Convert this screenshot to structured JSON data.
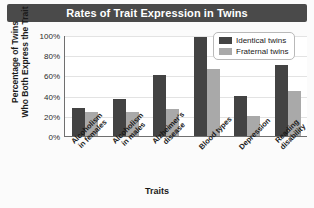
{
  "title": "Rates of Trait Expression in Twins",
  "legend": {
    "position": "top-right",
    "items": [
      {
        "label": "Identical twins",
        "color": "#434343",
        "key": "identical"
      },
      {
        "label": "Fraternal twins",
        "color": "#a9a9a9",
        "key": "fraternal"
      }
    ]
  },
  "axes": {
    "ylabel_line1": "Percentage of Twins",
    "ylabel_line2": "Who Both Express the Trait",
    "xlabel": "Traits",
    "yticks": [
      "0%",
      "20%",
      "40%",
      "60%",
      "80%",
      "100%"
    ]
  },
  "xtick_labels": [
    {
      "line1": "Alcoholism",
      "line2": "in females"
    },
    {
      "line1": "Alcoholism",
      "line2": "in males"
    },
    {
      "line1": "Alzheimer's",
      "line2": "disease"
    },
    {
      "line1": "Blood types",
      "line2": ""
    },
    {
      "line1": "Depression",
      "line2": ""
    },
    {
      "line1": "Reading",
      "line2": "disability"
    }
  ],
  "chart_data": {
    "type": "bar",
    "title": "Rates of Trait Expression in Twins",
    "xlabel": "Traits",
    "ylabel": "Percentage of Twins Who Both Express the Trait",
    "ylim": [
      0,
      100
    ],
    "ytick_values": [
      0,
      20,
      40,
      60,
      80,
      100
    ],
    "grid": true,
    "legend_position": "top-right",
    "categories": [
      "Alcoholism in females",
      "Alcoholism in males",
      "Alzheimer's disease",
      "Blood types",
      "Depression",
      "Reading disability"
    ],
    "series": [
      {
        "name": "Identical twins",
        "color": "#434343",
        "values": [
          28,
          37,
          60,
          98,
          40,
          70
        ]
      },
      {
        "name": "Fraternal twins",
        "color": "#a9a9a9",
        "values": [
          24,
          24,
          27,
          66,
          20,
          45
        ]
      }
    ]
  }
}
